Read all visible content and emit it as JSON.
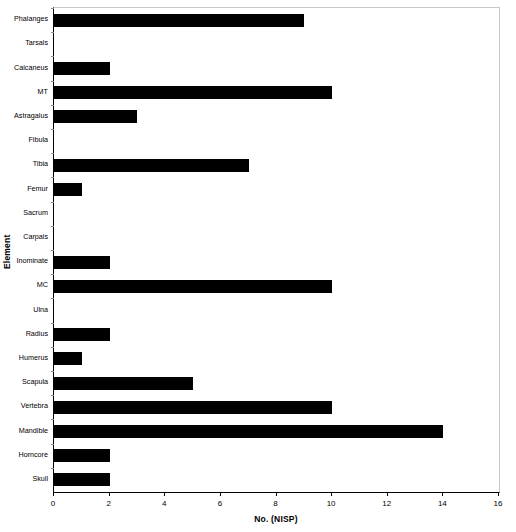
{
  "chart_data": {
    "type": "bar",
    "orientation": "horizontal",
    "title": "",
    "xlabel": "No. (NISP)",
    "ylabel": "Element",
    "xlim": [
      0,
      16
    ],
    "xticks": [
      0,
      2,
      4,
      6,
      8,
      10,
      12,
      14,
      16
    ],
    "grid": false,
    "legend": null,
    "bar_color": "#000000",
    "categories": [
      "Phalanges",
      "Tarsals",
      "Calcaneus",
      "MT",
      "Astragalus",
      "Fibula",
      "Tibia",
      "Femur",
      "Sacrum",
      "Carpals",
      "Inominate",
      "MC",
      "Ulna",
      "Radius",
      "Humerus",
      "Scapula",
      "Vertebra",
      "Mandible",
      "Horncore",
      "Skull"
    ],
    "values": [
      9,
      0,
      2,
      10,
      3,
      0,
      7,
      1,
      0,
      0,
      2,
      10,
      0,
      2,
      1,
      5,
      10,
      14,
      2,
      2
    ]
  }
}
